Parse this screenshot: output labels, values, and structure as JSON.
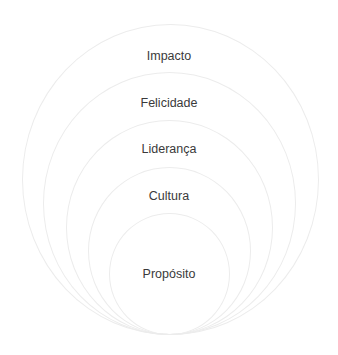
{
  "diagram": {
    "type": "nested-circles",
    "colors": {
      "ring_stroke": "#ececec",
      "text": "#3a3a3a",
      "background": "#ffffff"
    },
    "layers": [
      {
        "label": "Impacto"
      },
      {
        "label": "Felicidade"
      },
      {
        "label": "Liderança"
      },
      {
        "label": "Cultura"
      },
      {
        "label": "Propósito"
      }
    ]
  }
}
